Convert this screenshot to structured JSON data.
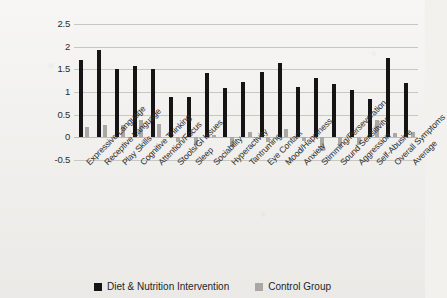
{
  "chart_data": {
    "type": "bar",
    "title": "",
    "xlabel": "",
    "ylabel": "",
    "ylim": [
      -0.5,
      2.5
    ],
    "ytick_labels": [
      "2.5",
      "2",
      "1.5",
      "1",
      "0.5",
      "0",
      "-0.5"
    ],
    "ytick_values": [
      2.5,
      2,
      1.5,
      1,
      0.5,
      0,
      -0.5
    ],
    "grid": true,
    "legend_position": "bottom",
    "categories": [
      "Expressive Language",
      "Receptive Language",
      "Play Skills",
      "Cognitive Thinking",
      "Attention/Focus",
      "Stools/GI Issues",
      "Sleep",
      "Sociability",
      "Hyperactivity",
      "Tantruming",
      "Eye Contact",
      "Mood/Happiness",
      "Anxiety",
      "Stimming/Perseveration",
      "Sound Sensitivity",
      "Aggression",
      "Self-Abusive",
      "Overall Symptoms",
      "Average"
    ],
    "series": [
      {
        "name": "Diet & Nutrition Intervention",
        "color": "#151515",
        "values": [
          1.7,
          1.92,
          1.5,
          1.58,
          1.5,
          0.9,
          0.9,
          1.42,
          1.08,
          1.22,
          1.45,
          1.63,
          1.12,
          1.3,
          1.18,
          1.05,
          0.85,
          1.75,
          1.2
        ]
      },
      {
        "name": "Control Group",
        "color": "#a9a8a4",
        "values": [
          0.22,
          0.28,
          0.28,
          0.38,
          0.3,
          -0.1,
          -0.18,
          0.05,
          -0.22,
          0.12,
          -0.1,
          0.18,
          -0.08,
          -0.3,
          -0.2,
          -0.18,
          0.38,
          0.1,
          0.12
        ]
      }
    ]
  },
  "legend": {
    "items": [
      {
        "label": "Diet & Nutrition Intervention",
        "color": "#151515"
      },
      {
        "label": "Control Group",
        "color": "#a9a8a4"
      }
    ]
  }
}
